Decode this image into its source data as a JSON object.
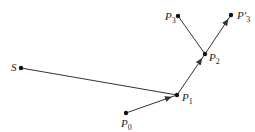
{
  "diagram": {
    "type": "point-path",
    "points": [
      {
        "id": "S",
        "label": "S",
        "sub": "",
        "x": 21,
        "y": 68,
        "lx": 11,
        "ly": 62
      },
      {
        "id": "P0",
        "label": "P",
        "sub": "0",
        "x": 126,
        "y": 113,
        "lx": 121,
        "ly": 118
      },
      {
        "id": "P1",
        "label": "P",
        "sub": "1",
        "x": 177,
        "y": 95,
        "lx": 182,
        "ly": 92
      },
      {
        "id": "P2",
        "label": "P",
        "sub": "2",
        "x": 205,
        "y": 54,
        "lx": 209,
        "ly": 52
      },
      {
        "id": "P3",
        "label": "P",
        "sub": "3",
        "x": 178,
        "y": 16,
        "lx": 165,
        "ly": 11
      },
      {
        "id": "P3p",
        "label": "P′",
        "sub": "3",
        "x": 231,
        "y": 15,
        "lx": 237,
        "ly": 10
      }
    ],
    "edges": [
      {
        "from": "S",
        "to": "P1",
        "arrow": false
      },
      {
        "from": "P0",
        "to": "P1",
        "arrow": true
      },
      {
        "from": "P1",
        "to": "P2",
        "arrow": true
      },
      {
        "from": "P2",
        "to": "P3",
        "arrow": false
      },
      {
        "from": "P2",
        "to": "P3p",
        "arrow": true
      }
    ],
    "line_color": "#333333",
    "point_color": "#111111"
  }
}
